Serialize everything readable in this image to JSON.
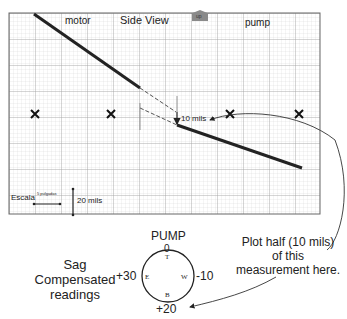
{
  "chart": {
    "labels": {
      "motor": "motor",
      "title": "Side View",
      "up_badge": "up",
      "pump": "pump",
      "measurement": "10 mils",
      "scale_label": "Escala",
      "scale_small": "5 pulgadas",
      "scale_vertical": "20 mils"
    },
    "markers": [
      "x",
      "x",
      "x",
      "x",
      "x"
    ]
  },
  "sag": {
    "title_line1": "Sag",
    "title_line2": "Compensated",
    "title_line3": "readings"
  },
  "dial": {
    "title": "PUMP",
    "top_value": "0",
    "left_value": "+30",
    "right_value": "-10",
    "bottom_value": "+20",
    "top_letter": "T",
    "left_letter": "E",
    "right_letter": "W",
    "bottom_letter": "B"
  },
  "note": {
    "line1": "Plot half (10 mils)",
    "line2": "of this",
    "line3": "measurement here."
  },
  "colors": {
    "line": "#222222",
    "grid_minor": "#d6d6d6",
    "grid_major": "#9a9a9a",
    "badge": "#8a8a8a"
  }
}
